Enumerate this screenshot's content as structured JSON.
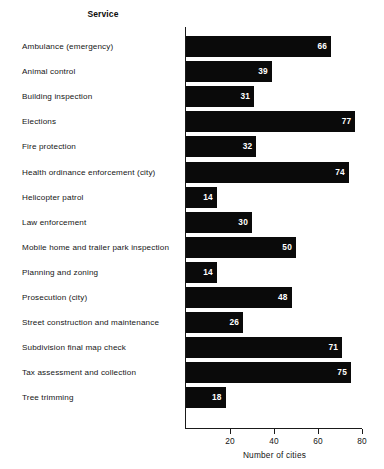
{
  "chart_data": {
    "type": "bar",
    "orientation": "horizontal",
    "title": "",
    "category_header": "Service",
    "xlabel": "Number of cities",
    "ylabel": "",
    "xlim": [
      0,
      80
    ],
    "xticks": [
      20,
      40,
      60,
      80
    ],
    "xtick_labels": [
      "20",
      "40",
      "60",
      "80"
    ],
    "grid": false,
    "legend": false,
    "bar_color": "#0a0a0a",
    "value_label_color": "#ffffff",
    "background_color": "#ffffff",
    "categories": [
      "Ambulance (emergency)",
      "Animal control",
      "Building inspection",
      "Elections",
      "Fire protection",
      "Health ordinance enforcement (city)",
      "Helicopter patrol",
      "Law enforcement",
      "Mobile home and trailer park inspection",
      "Planning and zoning",
      "Prosecution (city)",
      "Street construction and maintenance",
      "Subdivision final map check",
      "Tax assessment and collection",
      "Tree trimming"
    ],
    "values": [
      66,
      39,
      31,
      77,
      32,
      74,
      14,
      30,
      50,
      14,
      48,
      26,
      71,
      75,
      18
    ],
    "value_labels": [
      "66",
      "39",
      "31",
      "77",
      "32",
      "74",
      "14",
      "30",
      "50",
      "14",
      "48",
      "26",
      "71",
      "75",
      "18"
    ]
  }
}
